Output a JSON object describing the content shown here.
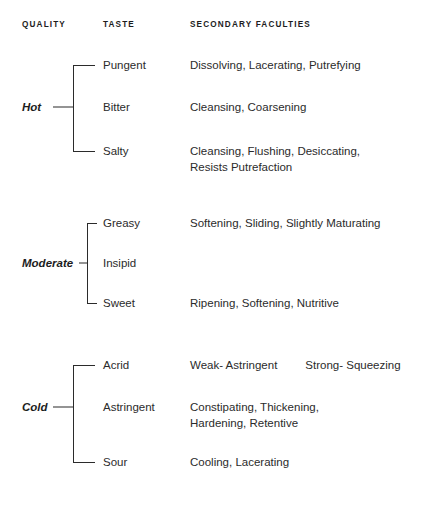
{
  "table": {
    "headers": {
      "quality": "QUALITY",
      "taste": "TASTE",
      "secondary": "SECONDARY FACULTIES"
    },
    "groups": [
      {
        "quality": "Hot",
        "rows": [
          {
            "taste": "Pungent",
            "faculties": [
              "Dissolving, Lacerating, Putrefying"
            ]
          },
          {
            "taste": "Bitter",
            "faculties": [
              "Cleansing, Coarsening"
            ]
          },
          {
            "taste": "Salty",
            "faculties": [
              "Cleansing, Flushing, Desiccating,",
              "Resists Putrefaction"
            ]
          }
        ]
      },
      {
        "quality": "Moderate",
        "rows": [
          {
            "taste": "Greasy",
            "faculties": [
              "Softening, Sliding, Slightly Maturating"
            ]
          },
          {
            "taste": "Insipid",
            "faculties": [
              ""
            ]
          },
          {
            "taste": "Sweet",
            "faculties": [
              "Ripening, Softening, Nutritive"
            ]
          }
        ]
      },
      {
        "quality": "Cold",
        "rows": [
          {
            "taste": "Acrid",
            "faculties_segments": [
              "Weak- Astringent",
              "Strong- Squeezing"
            ]
          },
          {
            "taste": "Astringent",
            "faculties": [
              "Constipating, Thickening,",
              "Hardening, Retentive"
            ]
          },
          {
            "taste": "Sour",
            "faculties": [
              "Cooling, Lacerating"
            ]
          }
        ]
      }
    ]
  },
  "style": {
    "text_color": "#2b2b2b",
    "heading_color": "#1d1d1d",
    "rule_color": "#2b2b2b",
    "background": "#ffffff"
  }
}
